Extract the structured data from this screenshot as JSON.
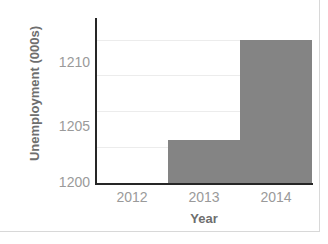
{
  "chart_data": {
    "type": "bar",
    "title": "",
    "categories": [
      "2012",
      "2013",
      "2014"
    ],
    "values": [
      1200,
      1203,
      1210
    ],
    "xlabel": "Year",
    "ylabel": "Unemployment (000s)",
    "ylim": [
      1200,
      1211.5
    ],
    "ytick_labels": [
      "1200",
      "1205",
      "1210"
    ],
    "ytick_values": [
      1200,
      1205,
      1210
    ],
    "gridlines": [
      1202.5,
      1205,
      1207.5,
      1210
    ],
    "grid": true,
    "legend": false,
    "bar_color": "#848484",
    "grid_color": "#ececec",
    "axis_color": "#262626",
    "tick_label_color": "#9a9a9a",
    "axis_title_color": "#6e6e6e",
    "background": "#ffffff",
    "frame_color": "#d8d8d8"
  },
  "axes": {
    "y": {
      "title": "Unemployment (000s)",
      "ticks": [
        {
          "label": "1210",
          "value": 1210
        },
        {
          "label": "1205",
          "value": 1205
        },
        {
          "label": "1200",
          "value": 1200
        }
      ]
    },
    "x": {
      "title": "Year",
      "ticks": [
        {
          "label": "2012"
        },
        {
          "label": "2013"
        },
        {
          "label": "2014"
        }
      ]
    }
  },
  "bars": [
    {
      "category": "2012",
      "value": 1200,
      "height_units": 0
    },
    {
      "category": "2013",
      "value": 1203,
      "height_units": 3
    },
    {
      "category": "2014",
      "value": 1210,
      "height_units": 10
    }
  ]
}
